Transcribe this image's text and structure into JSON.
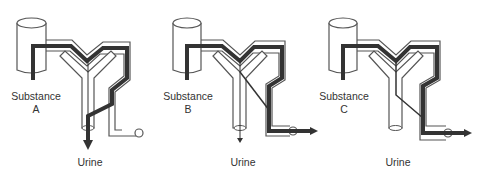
{
  "diagram": {
    "type": "nephron-clearance-comparison",
    "colors": {
      "outline": "#555555",
      "flow": "#333333",
      "background": "#ffffff"
    },
    "panels": [
      {
        "id": "A",
        "substance_label": "Substance",
        "substance_letter": "A",
        "output_label": "Urine",
        "pathway": "filtered-and-excreted-in-urine"
      },
      {
        "id": "B",
        "substance_label": "Substance",
        "substance_letter": "B",
        "output_label": "Urine",
        "pathway": "filtered-partially-reabsorbed-to-vein"
      },
      {
        "id": "C",
        "substance_label": "Substance",
        "substance_letter": "C",
        "output_label": "Urine",
        "pathway": "filtered-fully-reabsorbed-to-vein"
      }
    ]
  }
}
